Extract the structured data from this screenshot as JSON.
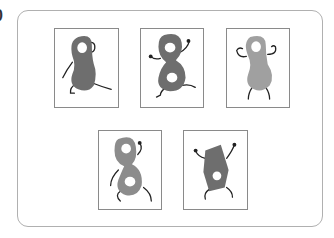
{
  "question": {
    "number_label": "0"
  },
  "colors": {
    "frame_border": "#b0b0b0",
    "card_border": "#8a8a8a",
    "dark_fill": "#6e6e6e",
    "mid_fill": "#8c8c8c",
    "light_fill": "#a0a0a0",
    "limb": "#222222"
  },
  "cards": [
    {
      "id": 1,
      "row": 1,
      "shape": "peanut-one-hole",
      "fill": "dark",
      "description": "gray gourd figure with one hole, walking"
    },
    {
      "id": 2,
      "row": 1,
      "shape": "figure-eight-two-holes",
      "fill": "dark",
      "description": "figure-eight with two holes, arms raised"
    },
    {
      "id": 3,
      "row": 1,
      "shape": "peanut-one-hole",
      "fill": "light",
      "description": "lighter gourd figure with one hole, arms flexed"
    },
    {
      "id": 4,
      "row": 2,
      "shape": "figure-eight-two-holes",
      "fill": "mid",
      "description": "slanted figure-eight with two holes"
    },
    {
      "id": 5,
      "row": 2,
      "shape": "polygon-one-hole",
      "fill": "dark",
      "description": "pentagon figure with one hole, arms up"
    }
  ]
}
